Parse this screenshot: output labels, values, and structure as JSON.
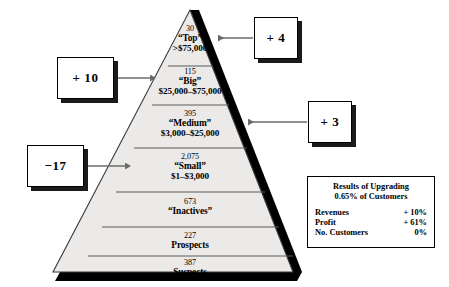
{
  "diagram": {
    "pyramid": {
      "fill_color": "#eceae8",
      "edge_color": "#3a3a3a",
      "shadow_color": "#000000",
      "tiers": [
        {
          "count": "30",
          "name": "“Top”",
          "range": ">$75,000"
        },
        {
          "count": "115",
          "name": "“Big”",
          "range": "$25,000–$75,000"
        },
        {
          "count": "395",
          "name": "“Medium”",
          "range": "$3,000–$25,000"
        },
        {
          "count": "2,075",
          "name": "“Small”",
          "range": "$1–$3,000"
        },
        {
          "count": "673",
          "name": "“Inactives”",
          "range": ""
        },
        {
          "count": "227",
          "name": "Prospects",
          "range": ""
        },
        {
          "count": "387",
          "name": "Suspects",
          "range": ""
        }
      ]
    },
    "callouts": [
      {
        "id": "top",
        "label": "+ 4",
        "side": "right"
      },
      {
        "id": "big",
        "label": "+ 10",
        "side": "left"
      },
      {
        "id": "medium",
        "label": "+ 3",
        "side": "right"
      },
      {
        "id": "small",
        "label": "−17",
        "side": "left"
      }
    ],
    "results": {
      "title_line1": "Results of Upgrading",
      "title_line2": "0.65% of Customers",
      "rows": [
        {
          "metric": "Revenues",
          "value": "+ 10%"
        },
        {
          "metric": "Profit",
          "value": "+ 61%"
        },
        {
          "metric": "No. Customers",
          "value": "0%"
        }
      ]
    }
  }
}
